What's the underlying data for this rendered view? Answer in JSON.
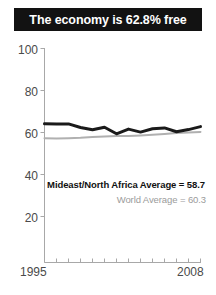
{
  "title": {
    "text": "The economy is 62.8% free"
  },
  "annotations": {
    "region_average": "Mideast/North Africa Average = 58.7",
    "world_average": "World Average = 60.3"
  },
  "axis": {
    "y_ticks": [
      "100",
      "80",
      "60",
      "40",
      "20"
    ],
    "x_start": "1995",
    "x_end": "2008"
  },
  "colors": {
    "banner_bg": "#121212",
    "banner_text": "#ffffff",
    "region_line": "#1a1a1a",
    "world_line": "#b0b0b0",
    "axis": "#a8a8a8",
    "tick_text": "#4a4a4a",
    "background": "#ffffff"
  },
  "chart_data": {
    "type": "line",
    "title": "The economy is 62.8% free",
    "xlabel": "",
    "ylabel": "",
    "xlim": [
      1995,
      2008
    ],
    "ylim": [
      0,
      100
    ],
    "yticks": [
      20,
      40,
      60,
      80,
      100
    ],
    "xticks": [
      1995,
      1996,
      1997,
      1998,
      1999,
      2000,
      2001,
      2002,
      2003,
      2004,
      2005,
      2006,
      2007,
      2008
    ],
    "grid": false,
    "legend": "none",
    "x": [
      1995,
      1996,
      1997,
      1998,
      1999,
      2000,
      2001,
      2002,
      2003,
      2004,
      2005,
      2006,
      2007,
      2008
    ],
    "series": [
      {
        "name": "Mideast/North Africa Average",
        "color": "#1a1a1a",
        "values": [
          64.2,
          64.0,
          64.1,
          62.4,
          61.3,
          62.5,
          59.4,
          61.6,
          60.2,
          61.8,
          62.2,
          60.4,
          61.4,
          62.8
        ]
      },
      {
        "name": "World Average",
        "color": "#b0b0b0",
        "values": [
          57.3,
          57.2,
          57.3,
          57.5,
          57.9,
          58.1,
          58.3,
          58.4,
          58.6,
          58.9,
          59.3,
          59.7,
          60.0,
          60.3
        ]
      }
    ],
    "annotations": [
      {
        "text": "Mideast/North Africa Average = 58.7",
        "value": 58.7
      },
      {
        "text": "World Average = 60.3",
        "value": 60.3
      }
    ]
  }
}
